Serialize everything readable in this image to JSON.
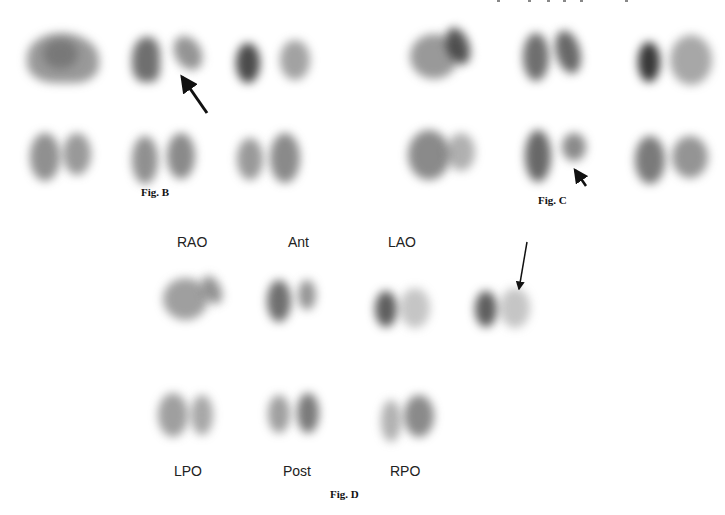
{
  "figures": {
    "fig_b": {
      "caption": "Fig. B",
      "rows": 2,
      "cols": 3,
      "panels": [
        {
          "row": 0,
          "col": 0,
          "x": 10,
          "y": 25,
          "w": 100,
          "h": 65
        },
        {
          "row": 0,
          "col": 1,
          "x": 115,
          "y": 25,
          "w": 95,
          "h": 70
        },
        {
          "row": 0,
          "col": 2,
          "x": 225,
          "y": 25,
          "w": 90,
          "h": 70
        },
        {
          "row": 1,
          "col": 0,
          "x": 25,
          "y": 125,
          "w": 70,
          "h": 60
        },
        {
          "row": 1,
          "col": 1,
          "x": 125,
          "y": 125,
          "w": 75,
          "h": 60
        },
        {
          "row": 1,
          "col": 2,
          "x": 230,
          "y": 125,
          "w": 75,
          "h": 60
        }
      ],
      "arrow": {
        "from": [
          207,
          113
        ],
        "to": [
          180,
          74
        ]
      }
    },
    "fig_c": {
      "caption": "Fig. C",
      "rows": 2,
      "cols": 3,
      "panels": [
        {
          "row": 0,
          "col": 0,
          "x": 400,
          "y": 25,
          "w": 75,
          "h": 60
        },
        {
          "row": 0,
          "col": 1,
          "x": 515,
          "y": 25,
          "w": 80,
          "h": 65
        },
        {
          "row": 0,
          "col": 2,
          "x": 630,
          "y": 30,
          "w": 90,
          "h": 65
        },
        {
          "row": 1,
          "col": 0,
          "x": 400,
          "y": 125,
          "w": 80,
          "h": 60
        },
        {
          "row": 1,
          "col": 1,
          "x": 520,
          "y": 125,
          "w": 75,
          "h": 60
        },
        {
          "row": 1,
          "col": 2,
          "x": 630,
          "y": 130,
          "w": 90,
          "h": 55
        }
      ],
      "arrow": {
        "from": [
          586,
          186
        ],
        "to": [
          573,
          167
        ]
      }
    },
    "fig_d": {
      "caption": "Fig. D",
      "top_labels": [
        "RAO",
        "Ant",
        "LAO"
      ],
      "bottom_labels": [
        "LPO",
        "Post",
        "RPO"
      ],
      "arrow": {
        "from": [
          527,
          242
        ],
        "to": [
          518,
          294
        ]
      }
    }
  }
}
